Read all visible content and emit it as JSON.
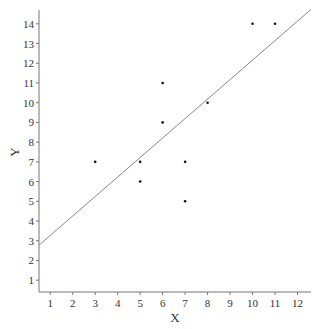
{
  "chart_data": {
    "type": "scatter",
    "title": "",
    "xlabel": "X",
    "ylabel": "Y",
    "xlim": [
      0.5,
      12.6
    ],
    "ylim": [
      0.4,
      14.7
    ],
    "xticks": [
      1,
      2,
      3,
      4,
      5,
      6,
      7,
      8,
      9,
      10,
      11,
      12
    ],
    "yticks": [
      1,
      2,
      3,
      4,
      5,
      6,
      7,
      8,
      9,
      10,
      11,
      12,
      13,
      14
    ],
    "grid": false,
    "legend": null,
    "series": [
      {
        "name": "data",
        "points": [
          {
            "x": 3,
            "y": 7
          },
          {
            "x": 5,
            "y": 7
          },
          {
            "x": 5,
            "y": 6
          },
          {
            "x": 6,
            "y": 11
          },
          {
            "x": 6,
            "y": 9
          },
          {
            "x": 7,
            "y": 7
          },
          {
            "x": 7,
            "y": 5
          },
          {
            "x": 8,
            "y": 10
          },
          {
            "x": 10,
            "y": 14
          },
          {
            "x": 11,
            "y": 14
          }
        ]
      }
    ],
    "fit_line": {
      "name": "linear fit",
      "intercept": 2.28,
      "slope": 0.988,
      "x_range": [
        0.5,
        12.6
      ]
    },
    "colors": {
      "points": "#111111",
      "fit_line": "#888888",
      "axes": "#777777",
      "text": "#333333"
    }
  }
}
